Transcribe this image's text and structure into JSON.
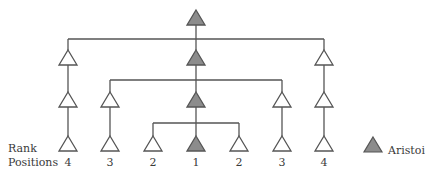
{
  "diagram": {
    "type": "hierarchy-tree",
    "colors": {
      "line": "#555555",
      "aristoi_fill": "#8c8c8c",
      "member_fill": "#ffffff"
    },
    "row_label_line1": "Rank",
    "row_label_line2": "Positions",
    "rank_positions": [
      {
        "x": 68,
        "label": "4"
      },
      {
        "x": 110,
        "label": "3"
      },
      {
        "x": 153,
        "label": "2"
      },
      {
        "x": 196,
        "label": "1"
      },
      {
        "x": 239,
        "label": "2"
      },
      {
        "x": 282,
        "label": "3"
      },
      {
        "x": 324,
        "label": "4"
      }
    ],
    "nodes": [
      {
        "id": "top",
        "x": 196,
        "y": 10,
        "aristoi": true
      },
      {
        "id": "r2-left",
        "x": 68,
        "y": 50,
        "aristoi": false
      },
      {
        "id": "r2-center",
        "x": 196,
        "y": 50,
        "aristoi": true
      },
      {
        "id": "r2-right",
        "x": 324,
        "y": 50,
        "aristoi": false
      },
      {
        "id": "r3-4L",
        "x": 68,
        "y": 92,
        "aristoi": false
      },
      {
        "id": "r3-3L",
        "x": 110,
        "y": 92,
        "aristoi": false
      },
      {
        "id": "r3-center",
        "x": 196,
        "y": 92,
        "aristoi": true
      },
      {
        "id": "r3-3R",
        "x": 282,
        "y": 92,
        "aristoi": false
      },
      {
        "id": "r3-4R",
        "x": 324,
        "y": 92,
        "aristoi": false
      },
      {
        "id": "r4-4L",
        "x": 68,
        "y": 136,
        "aristoi": false
      },
      {
        "id": "r4-3L",
        "x": 110,
        "y": 136,
        "aristoi": false
      },
      {
        "id": "r4-2L",
        "x": 153,
        "y": 136,
        "aristoi": false
      },
      {
        "id": "r4-1",
        "x": 196,
        "y": 136,
        "aristoi": true
      },
      {
        "id": "r4-2R",
        "x": 239,
        "y": 136,
        "aristoi": false
      },
      {
        "id": "r4-3R",
        "x": 282,
        "y": 136,
        "aristoi": false
      },
      {
        "id": "r4-4R",
        "x": 324,
        "y": 136,
        "aristoi": false
      }
    ],
    "branches": [
      {
        "y": 39,
        "x1": 68,
        "x2": 324
      },
      {
        "y": 80,
        "x1": 110,
        "x2": 282
      },
      {
        "y": 123,
        "x1": 153,
        "x2": 239
      }
    ],
    "legend": {
      "label": "Aristoi",
      "symbol": "gray-triangle"
    }
  }
}
